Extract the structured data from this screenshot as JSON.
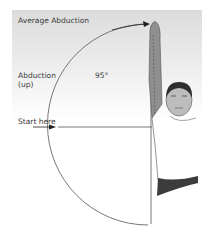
{
  "diagram": {
    "title": "Average Abduction",
    "movement_label_line1": "Abduction",
    "movement_label_line2": "(up)",
    "angle_label": "95°",
    "start_label": "Start here",
    "colors": {
      "arm": "#8f8f8f",
      "shirt": "#3c3c3c",
      "line": "#555555",
      "text": "#3a3a3a"
    }
  }
}
